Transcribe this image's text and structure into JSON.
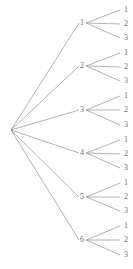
{
  "diagram": {
    "type": "tree",
    "title": "",
    "orientation": "left-to-right",
    "line_color": "#808080",
    "text_color": "#6e6e6e",
    "background_color": "#ffffff",
    "root": {
      "label": "",
      "x": 11,
      "y": 130
    },
    "level1_nodes": [
      {
        "label": "1",
        "x": 84,
        "y": 23
      },
      {
        "label": "2",
        "x": 84,
        "y": 66
      },
      {
        "label": "3",
        "x": 84,
        "y": 110
      },
      {
        "label": "4",
        "x": 84,
        "y": 153
      },
      {
        "label": "5",
        "x": 84,
        "y": 197
      },
      {
        "label": "6",
        "x": 84,
        "y": 240
      }
    ],
    "leaf_nodes": [
      {
        "label": "1",
        "x": 124,
        "y": 10,
        "parent": "1"
      },
      {
        "label": "2",
        "x": 124,
        "y": 24,
        "parent": "1"
      },
      {
        "label": "3",
        "x": 124,
        "y": 38,
        "parent": "1"
      },
      {
        "label": "1",
        "x": 124,
        "y": 53,
        "parent": "2"
      },
      {
        "label": "2",
        "x": 124,
        "y": 67,
        "parent": "2"
      },
      {
        "label": "3",
        "x": 124,
        "y": 81,
        "parent": "2"
      },
      {
        "label": "1",
        "x": 124,
        "y": 96,
        "parent": "3"
      },
      {
        "label": "2",
        "x": 124,
        "y": 110,
        "parent": "3"
      },
      {
        "label": "3",
        "x": 124,
        "y": 125,
        "parent": "3"
      },
      {
        "label": "1",
        "x": 124,
        "y": 140,
        "parent": "4"
      },
      {
        "label": "2",
        "x": 124,
        "y": 154,
        "parent": "4"
      },
      {
        "label": "3",
        "x": 124,
        "y": 168,
        "parent": "4"
      },
      {
        "label": "1",
        "x": 124,
        "y": 183,
        "parent": "5"
      },
      {
        "label": "2",
        "x": 124,
        "y": 197,
        "parent": "5"
      },
      {
        "label": "3",
        "x": 124,
        "y": 211,
        "parent": "5"
      },
      {
        "label": "1",
        "x": 124,
        "y": 226,
        "parent": "6"
      },
      {
        "label": "2",
        "x": 124,
        "y": 240,
        "parent": "6"
      },
      {
        "label": "3",
        "x": 124,
        "y": 255,
        "parent": "6"
      }
    ],
    "edges_root_to_level1": [
      {
        "from": "root",
        "to": "1"
      },
      {
        "from": "root",
        "to": "2"
      },
      {
        "from": "root",
        "to": "3"
      },
      {
        "from": "root",
        "to": "4"
      },
      {
        "from": "root",
        "to": "5"
      },
      {
        "from": "root",
        "to": "6"
      }
    ],
    "edges_level1_to_leaf": [
      {
        "from": "1",
        "to": "1"
      },
      {
        "from": "1",
        "to": "2"
      },
      {
        "from": "1",
        "to": "3"
      },
      {
        "from": "2",
        "to": "1"
      },
      {
        "from": "2",
        "to": "2"
      },
      {
        "from": "2",
        "to": "3"
      },
      {
        "from": "3",
        "to": "1"
      },
      {
        "from": "3",
        "to": "2"
      },
      {
        "from": "3",
        "to": "3"
      },
      {
        "from": "4",
        "to": "1"
      },
      {
        "from": "4",
        "to": "2"
      },
      {
        "from": "4",
        "to": "3"
      },
      {
        "from": "5",
        "to": "1"
      },
      {
        "from": "5",
        "to": "2"
      },
      {
        "from": "5",
        "to": "3"
      },
      {
        "from": "6",
        "to": "1"
      },
      {
        "from": "6",
        "to": "2"
      },
      {
        "from": "6",
        "to": "3"
      }
    ]
  }
}
